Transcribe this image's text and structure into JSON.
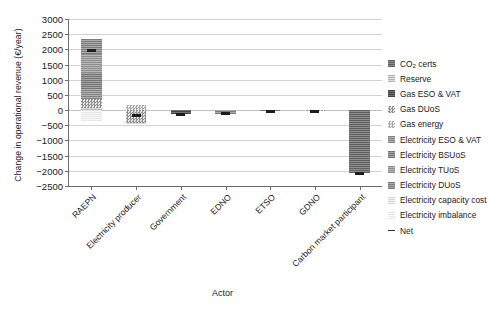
{
  "chart_data": {
    "type": "bar",
    "subtype": "stacked-bar-with-net-marker",
    "title": "",
    "xlabel": "Actor",
    "ylabel": "Change in operational revenue (€/year)",
    "ylim": [
      -2500,
      3000
    ],
    "ytick_step": 500,
    "yticks": [
      3000,
      2500,
      2000,
      1500,
      1000,
      500,
      0,
      -500,
      -1000,
      -1500,
      -2000,
      -2500
    ],
    "ytick_labels": [
      "3000",
      "2500",
      "2000",
      "1500",
      "1000",
      "500",
      "0",
      "−500",
      "−1000",
      "−1500",
      "−2000",
      "−2500"
    ],
    "grid": true,
    "grid_axis": "y",
    "legend_position": "right",
    "categories": [
      "RAEPN",
      "Electricity producer",
      "Government",
      "EDNO",
      "ETSO",
      "GDNO",
      "Carbon market participant"
    ],
    "series": [
      {
        "name": "CO2 certs",
        "key": "co2",
        "fill": "f-co2",
        "values": [
          0,
          0,
          0,
          0,
          0,
          0,
          -2080
        ]
      },
      {
        "name": "Reserve",
        "key": "reserve",
        "fill": "f-reserve",
        "values": [
          80,
          0,
          0,
          0,
          0,
          0,
          0
        ]
      },
      {
        "name": "Gas ESO & VAT",
        "key": "gasesovat",
        "fill": "f-gasesovat",
        "values": [
          0,
          0,
          -145,
          0,
          0,
          0,
          0
        ]
      },
      {
        "name": "Gas DUoS",
        "key": "gasduos",
        "fill": "f-gasduos",
        "values": [
          300,
          -420,
          0,
          0,
          0,
          -45,
          0
        ]
      },
      {
        "name": "Gas energy",
        "key": "gasenergy",
        "fill": "f-gasenergy",
        "values": [
          0,
          155,
          0,
          0,
          0,
          0,
          0
        ]
      },
      {
        "name": "Electricity ESO & VAT",
        "key": "elesovat",
        "fill": "f-elesovat",
        "values": [
          320,
          0,
          0,
          0,
          0,
          0,
          0
        ]
      },
      {
        "name": "Electricity BSUoS",
        "key": "elebsuos",
        "fill": "f-elebsuos",
        "values": [
          520,
          0,
          0,
          0,
          -30,
          0,
          0
        ]
      },
      {
        "name": "Electricity TUoS",
        "key": "eletuos",
        "fill": "f-eletuos",
        "values": [
          620,
          0,
          0,
          0,
          0,
          0,
          0
        ]
      },
      {
        "name": "Electricity DUoS",
        "key": "eleduos",
        "fill": "f-eleduos",
        "values": [
          490,
          0,
          0,
          -120,
          0,
          0,
          0
        ]
      },
      {
        "name": "Electricity capacity cost",
        "key": "elecap",
        "fill": "f-elecap",
        "values": [
          0,
          -30,
          0,
          0,
          0,
          0,
          0
        ]
      },
      {
        "name": "Electricity imbalance",
        "key": "eleimb",
        "fill": "f-eleimb",
        "values": [
          -370,
          0,
          0,
          0,
          0,
          0,
          0
        ]
      }
    ],
    "net": {
      "name": "Net",
      "values": [
        1960,
        -170,
        -145,
        -120,
        -30,
        -45,
        -2080
      ]
    }
  },
  "axes": {
    "ylabel": "Change in operational revenue (€/year)",
    "xlabel": "Actor"
  },
  "legend": {
    "items": [
      {
        "label": "CO",
        "sub": "2",
        "label_tail": " certs",
        "marker": "swatch",
        "fill": "f-co2"
      },
      {
        "label": "Reserve",
        "marker": "swatch",
        "fill": "f-reserve"
      },
      {
        "label": "Gas ESO & VAT",
        "marker": "swatch",
        "fill": "f-gasesovat"
      },
      {
        "label": "Gas DUoS",
        "marker": "swatch",
        "fill": "f-gasduos"
      },
      {
        "label": "Gas energy",
        "marker": "swatch",
        "fill": "f-gasenergy"
      },
      {
        "label": "Electricity ESO & VAT",
        "marker": "swatch",
        "fill": "f-elesovat"
      },
      {
        "label": "Electricity BSUoS",
        "marker": "swatch",
        "fill": "f-elebsuos"
      },
      {
        "label": "Electricity TUoS",
        "marker": "swatch",
        "fill": "f-eletuos"
      },
      {
        "label": "Electricity DUoS",
        "marker": "swatch",
        "fill": "f-eleduos"
      },
      {
        "label": "Electricity capacity cost",
        "marker": "swatch",
        "fill": "f-elecap"
      },
      {
        "label": "Electricity imbalance",
        "marker": "swatch",
        "fill": "f-eleimb"
      },
      {
        "label": "Net",
        "marker": "dash",
        "fill": ""
      }
    ]
  },
  "colors": {
    "grid": "#d3d3d3",
    "axis": "#6d6d6d",
    "net_marker": "#1d1d1d",
    "text": "#1a1a1a"
  }
}
